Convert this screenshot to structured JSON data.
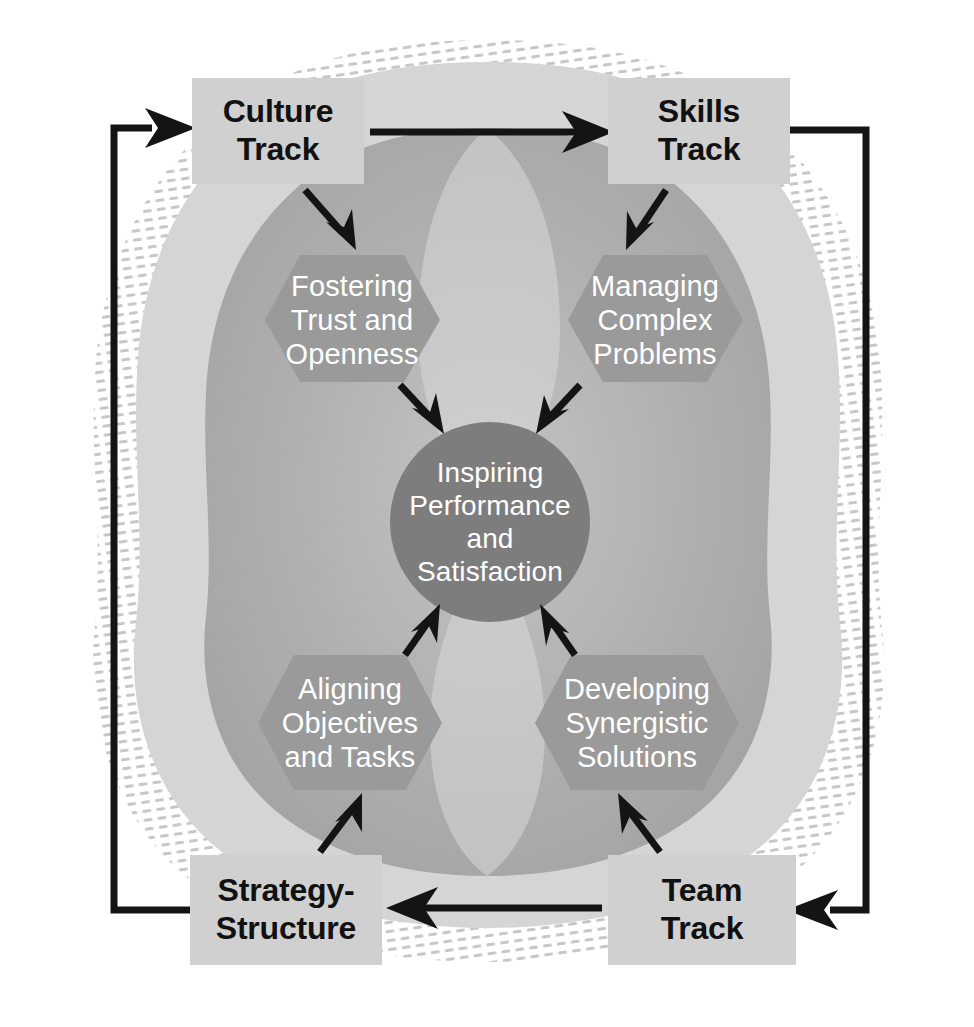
{
  "diagram": {
    "colors": {
      "page_background": "#ffffff",
      "outer_blob": "#d2d2d2",
      "inner_blob": "#a8a8a8",
      "hexagon": "#999999",
      "core_circle": "#808080",
      "track_box": "#cfcfcf",
      "track_box_text": "#111111",
      "hexagon_text": "#ffffff",
      "core_text": "#ffffff",
      "arrow": "#111111",
      "texture_hatch": "#c9c9c9"
    },
    "tracks": [
      {
        "id": "culture-track",
        "label": "Culture\nTrack",
        "position": "top-left",
        "x": 192,
        "y": 78,
        "w": 172,
        "h": 106
      },
      {
        "id": "skills-track",
        "label": "Skills\nTrack",
        "position": "top-right",
        "x": 608,
        "y": 78,
        "w": 182,
        "h": 106
      },
      {
        "id": "strategy-structure-track",
        "label": "Strategy-\nStructure",
        "position": "bottom-left",
        "x": 190,
        "y": 855,
        "w": 192,
        "h": 110
      },
      {
        "id": "team-track",
        "label": "Team\nTrack",
        "position": "bottom-right",
        "x": 608,
        "y": 855,
        "w": 188,
        "h": 110
      }
    ],
    "hexagons": [
      {
        "id": "fostering-trust-and-openness",
        "label": "Fostering\nTrust and\nOpenness",
        "position": "upper-left",
        "cx": 352,
        "cy": 320
      },
      {
        "id": "managing-complex-problems",
        "label": "Managing\nComplex\nProblems",
        "position": "upper-right",
        "cx": 655,
        "cy": 320
      },
      {
        "id": "aligning-objectives-and-tasks",
        "label": "Aligning\nObjectives\nand Tasks",
        "position": "lower-left",
        "cx": 350,
        "cy": 723
      },
      {
        "id": "developing-synergistic-solutions",
        "label": "Developing\nSynergistic\nSolutions",
        "position": "lower-right",
        "cx": 637,
        "cy": 723
      }
    ],
    "core": {
      "id": "inspiring-performance-and-satisfaction",
      "label": "Inspiring\nPerformance\nand\nSatisfaction",
      "cx": 490,
      "cy": 522,
      "r": 100
    },
    "arrows": [
      {
        "id": "culture-to-skills",
        "from": "culture-track",
        "to": "skills-track",
        "kind": "straight-horizontal"
      },
      {
        "id": "team-to-strategy",
        "from": "team-track",
        "to": "strategy-structure-track",
        "kind": "straight-horizontal"
      },
      {
        "id": "skills-to-team-loop",
        "from": "skills-track",
        "to": "team-track",
        "kind": "right-elbow"
      },
      {
        "id": "strategy-to-culture-loop",
        "from": "strategy-structure-track",
        "to": "culture-track",
        "kind": "left-elbow"
      },
      {
        "id": "culture-to-fostering",
        "from": "culture-track",
        "to": "fostering-trust-and-openness",
        "kind": "diagonal"
      },
      {
        "id": "skills-to-managing",
        "from": "skills-track",
        "to": "managing-complex-problems",
        "kind": "diagonal"
      },
      {
        "id": "strategy-to-aligning",
        "from": "strategy-structure-track",
        "to": "aligning-objectives-and-tasks",
        "kind": "diagonal"
      },
      {
        "id": "team-to-developing",
        "from": "team-track",
        "to": "developing-synergistic-solutions",
        "kind": "diagonal"
      },
      {
        "id": "fostering-to-core",
        "from": "fostering-trust-and-openness",
        "to": "inspiring-performance-and-satisfaction",
        "kind": "diagonal"
      },
      {
        "id": "managing-to-core",
        "from": "managing-complex-problems",
        "to": "inspiring-performance-and-satisfaction",
        "kind": "diagonal"
      },
      {
        "id": "aligning-to-core",
        "from": "aligning-objectives-and-tasks",
        "to": "inspiring-performance-and-satisfaction",
        "kind": "diagonal"
      },
      {
        "id": "developing-to-core",
        "from": "developing-synergistic-solutions",
        "to": "inspiring-performance-and-satisfaction",
        "kind": "diagonal"
      }
    ]
  }
}
